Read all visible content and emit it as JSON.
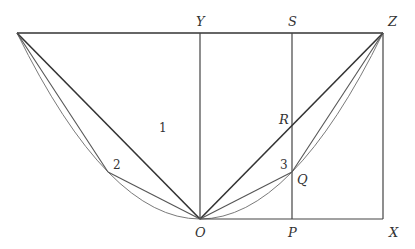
{
  "diagram": {
    "points": {
      "A": {
        "x": 17,
        "y": 33
      },
      "Y": {
        "x": 200,
        "y": 33
      },
      "S": {
        "x": 292,
        "y": 33
      },
      "Z": {
        "x": 383,
        "y": 33
      },
      "R": {
        "x": 292,
        "y": 127
      },
      "Q": {
        "x": 292,
        "y": 172
      },
      "P2": {
        "x": 108,
        "y": 172
      },
      "O": {
        "x": 200,
        "y": 219
      },
      "P": {
        "x": 292,
        "y": 219
      },
      "X": {
        "x": 383,
        "y": 219
      }
    },
    "labels": {
      "Y": "Y",
      "S": "S",
      "Z": "Z",
      "R": "R",
      "Q": "Q",
      "O": "O",
      "P": "P",
      "X": "X",
      "region1": "1",
      "region2": "2",
      "region3": "3"
    },
    "colors": {
      "line": "#333333",
      "curve": "#777777"
    }
  }
}
